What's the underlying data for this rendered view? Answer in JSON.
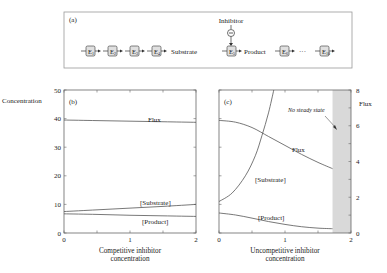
{
  "panel_a": {
    "label": "(a)",
    "inhibitor_label": "Inhibitor",
    "inhibitor_sign": "−",
    "enzymes": [
      "E1",
      "E2",
      "E3",
      "E4",
      "E5",
      "E6",
      "E10"
    ],
    "enzyme_subs": [
      "1",
      "2",
      "3",
      "4",
      "5",
      "6",
      "10"
    ],
    "substrate_label": "Substrate",
    "product_label": "Product",
    "ellipsis": "···"
  },
  "chart_data": [
    {
      "panel": "(b)",
      "type": "line",
      "title": "",
      "xlabel": "Competitive inhibitor concentration",
      "xlabel_lines": [
        "Competitive inhibitor",
        "concentration"
      ],
      "ylabel": "Concentration",
      "xlim": [
        0,
        2
      ],
      "ylim": [
        0,
        50
      ],
      "xticks": [
        "0",
        "1",
        "2"
      ],
      "yticks": [
        "0",
        "10",
        "20",
        "30",
        "40",
        "50"
      ],
      "grid": false,
      "series": [
        {
          "name": "Flux",
          "axis": "left",
          "x": [
            0,
            0.5,
            1,
            1.5,
            2
          ],
          "values": [
            39.5,
            39.3,
            39.1,
            38.9,
            38.7
          ]
        },
        {
          "name": "[Substrate]",
          "axis": "left",
          "x": [
            0,
            0.5,
            1,
            1.5,
            2
          ],
          "values": [
            7.5,
            8.1,
            8.7,
            9.3,
            10.0
          ]
        },
        {
          "name": "[Product]",
          "axis": "left",
          "x": [
            0,
            0.5,
            1,
            1.5,
            2
          ],
          "values": [
            6.7,
            6.5,
            6.2,
            6.0,
            5.8
          ]
        }
      ]
    },
    {
      "panel": "(c)",
      "type": "line",
      "title": "",
      "xlabel": "Uncompetitive inhibitor concentration",
      "xlabel_lines": [
        "Uncompetitive inhibitor",
        "concentration"
      ],
      "ylabel_right": "Flux",
      "xlim": [
        0,
        2
      ],
      "ylim_left": [
        0,
        50
      ],
      "ylim_right": [
        0,
        8
      ],
      "xticks": [
        "0",
        "1",
        "2"
      ],
      "yticks_right": [
        "0",
        "2",
        "4",
        "6",
        "8"
      ],
      "grid": false,
      "shaded_region": {
        "x_from": 1.72,
        "x_to": 2,
        "label": "No steady state",
        "color": "#d9d9d9"
      },
      "series": [
        {
          "name": "Flux",
          "axis": "right",
          "x": [
            0,
            0.25,
            0.5,
            0.75,
            1.0,
            1.25,
            1.5,
            1.72
          ],
          "values": [
            6.3,
            6.2,
            5.9,
            5.4,
            4.9,
            4.4,
            3.95,
            3.6
          ]
        },
        {
          "name": "[Substrate]",
          "axis": "left",
          "x": [
            0,
            0.2,
            0.4,
            0.55,
            0.65,
            0.75,
            0.83
          ],
          "values": [
            11,
            14,
            20,
            27,
            34,
            42,
            50
          ]
        },
        {
          "name": "[Product]",
          "axis": "left",
          "x": [
            0,
            0.25,
            0.5,
            0.75,
            1.0,
            1.25,
            1.5,
            1.72
          ],
          "values": [
            7.0,
            6.3,
            5.2,
            4.0,
            3.0,
            2.2,
            1.7,
            1.5
          ]
        }
      ]
    }
  ],
  "labels": {
    "panel_b": "(b)",
    "panel_c": "(c)",
    "concentration": "Concentration",
    "flux_right": "Flux",
    "b_flux": "Flux",
    "b_substrate": "[Substrate]",
    "b_product": "[Product]",
    "c_flux": "Flux",
    "c_substrate": "[Substrate]",
    "c_product": "[Product]",
    "no_steady_state": "No steady state",
    "b_xlabel_1": "Competitive inhibitor",
    "b_xlabel_2": "concentration",
    "c_xlabel_1": "Uncompetitive inhibitor",
    "c_xlabel_2": "concentration"
  },
  "colors": {
    "line": "#555555",
    "axis": "#666666",
    "shade": "#d9d9d9",
    "enzyme_box": "#e0e0e0"
  }
}
